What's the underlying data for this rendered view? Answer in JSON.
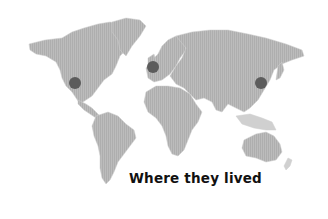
{
  "map": {
    "caption": "Where they lived",
    "land_color": "#b9b9b9",
    "land_light_color": "#d4d4d4",
    "marker_color": "#5c5c5c",
    "background_color": "#ffffff",
    "markers": [
      {
        "name": "western-united-states",
        "x": 75,
        "y": 83,
        "r": 6
      },
      {
        "name": "united-kingdom",
        "x": 153,
        "y": 67,
        "r": 6
      },
      {
        "name": "eastern-china",
        "x": 261,
        "y": 83,
        "r": 6
      }
    ]
  }
}
